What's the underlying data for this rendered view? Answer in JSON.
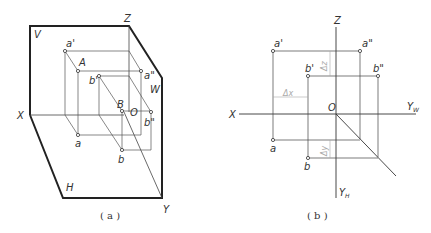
{
  "figure_a": {
    "caption": "( a )",
    "planes": {
      "V": "V",
      "H": "H",
      "W": "W"
    },
    "axes": {
      "X": "X",
      "Y": "Y",
      "Z": "Z",
      "O": "O"
    },
    "points": {
      "a_prime": "a'",
      "A": "A",
      "a_dprime": "a\"",
      "a": "a",
      "b_prime": "b'",
      "B": "B",
      "b_dprime": "b\"",
      "b": "b"
    }
  },
  "figure_b": {
    "caption": "( b )",
    "axes": {
      "X": "X",
      "Z": "Z",
      "O": "O",
      "YW": "Y",
      "YW_sub": "W",
      "YH": "Y",
      "YH_sub": "H"
    },
    "points": {
      "a_prime": "a'",
      "a_dprime": "a\"",
      "b_prime": "b'",
      "b_dprime": "b\"",
      "a": "a",
      "b": "b"
    },
    "dimensions": {
      "dx": "Δx",
      "dy": "Δy",
      "dz": "Δz"
    }
  },
  "colors": {
    "line": "#333333",
    "thick": "#222222",
    "dim": "#aaaaaa"
  }
}
